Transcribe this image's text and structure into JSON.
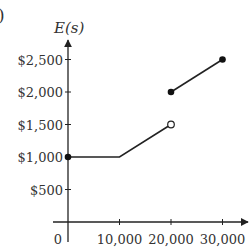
{
  "figure_label": ")",
  "chart_data": {
    "type": "line",
    "title": "",
    "ylabel": "E(s)",
    "xlabel": "",
    "x_ticks": [
      0,
      10000,
      20000,
      30000
    ],
    "x_tick_labels": [
      "0",
      "10,000",
      "20,000",
      "30,000"
    ],
    "y_ticks": [
      500,
      1000,
      1500,
      2000,
      2500
    ],
    "y_tick_labels": [
      "$500",
      "$1,000",
      "$1,500",
      "$2,000",
      "$2,500"
    ],
    "xlim": [
      0,
      30000
    ],
    "ylim": [
      0,
      2500
    ],
    "grid": false,
    "series": [
      {
        "name": "segment-1",
        "points": [
          [
            0,
            1000
          ],
          [
            10000,
            1000
          ],
          [
            20000,
            1500
          ]
        ],
        "start": "closed",
        "end": "open"
      },
      {
        "name": "segment-2",
        "points": [
          [
            20000,
            2000
          ],
          [
            30000,
            2500
          ]
        ],
        "start": "closed",
        "end": "closed"
      }
    ]
  }
}
